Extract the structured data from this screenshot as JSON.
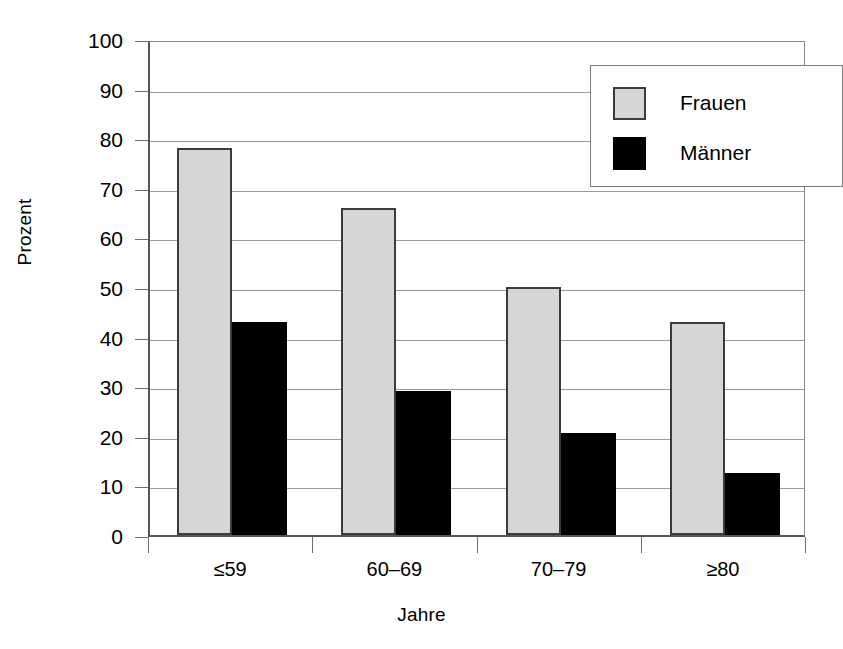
{
  "chart_data": {
    "type": "bar",
    "title": "",
    "xlabel": "Jahre",
    "ylabel": "Prozent",
    "categories": [
      "≤59",
      "60–69",
      "70–79",
      "≥80"
    ],
    "series": [
      {
        "name": "Frauen",
        "color": "#d6d6d6",
        "values": [
          78,
          66,
          50,
          43
        ]
      },
      {
        "name": "Männer",
        "color": "#000000",
        "values": [
          43,
          29,
          20.5,
          12.5
        ]
      }
    ],
    "ylim": [
      0,
      100
    ],
    "yticks": [
      0,
      10,
      20,
      30,
      40,
      50,
      60,
      70,
      80,
      90,
      100
    ],
    "ytick_labels": [
      "0",
      "10",
      "20",
      "30",
      "40",
      "50",
      "60",
      "70",
      "80",
      "90",
      "100"
    ],
    "grid": true,
    "legend_position": "top-right",
    "legend_entries": [
      "Frauen",
      "Männer"
    ]
  }
}
